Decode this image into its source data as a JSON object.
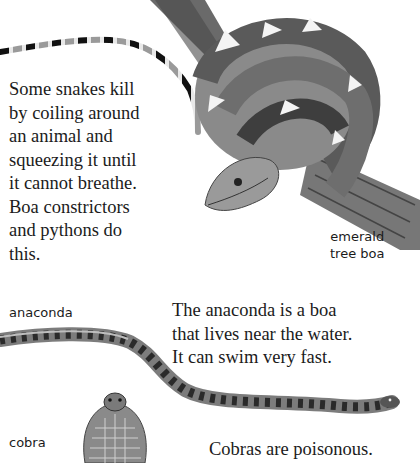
{
  "page": {
    "paragraphs": [
      {
        "id": "constrictors",
        "lines": [
          "Some snakes kill",
          "by coiling around",
          "an animal and",
          "squeezing it until",
          "it cannot breathe.",
          "Boa constrictors",
          "and pythons do",
          "this."
        ]
      },
      {
        "id": "anaconda",
        "lines": [
          "The anaconda is a boa",
          "that lives near the water.",
          "It can swim very fast."
        ]
      },
      {
        "id": "cobra",
        "lines": [
          "Cobras are poisonous."
        ]
      }
    ],
    "labels": {
      "emerald_tree_boa": [
        "emerald",
        "tree boa"
      ],
      "anaconda": "anaconda",
      "cobra": "cobra"
    },
    "illustrations": [
      "banded-snake",
      "emerald-tree-boa-on-branch",
      "anaconda",
      "cobra"
    ]
  }
}
